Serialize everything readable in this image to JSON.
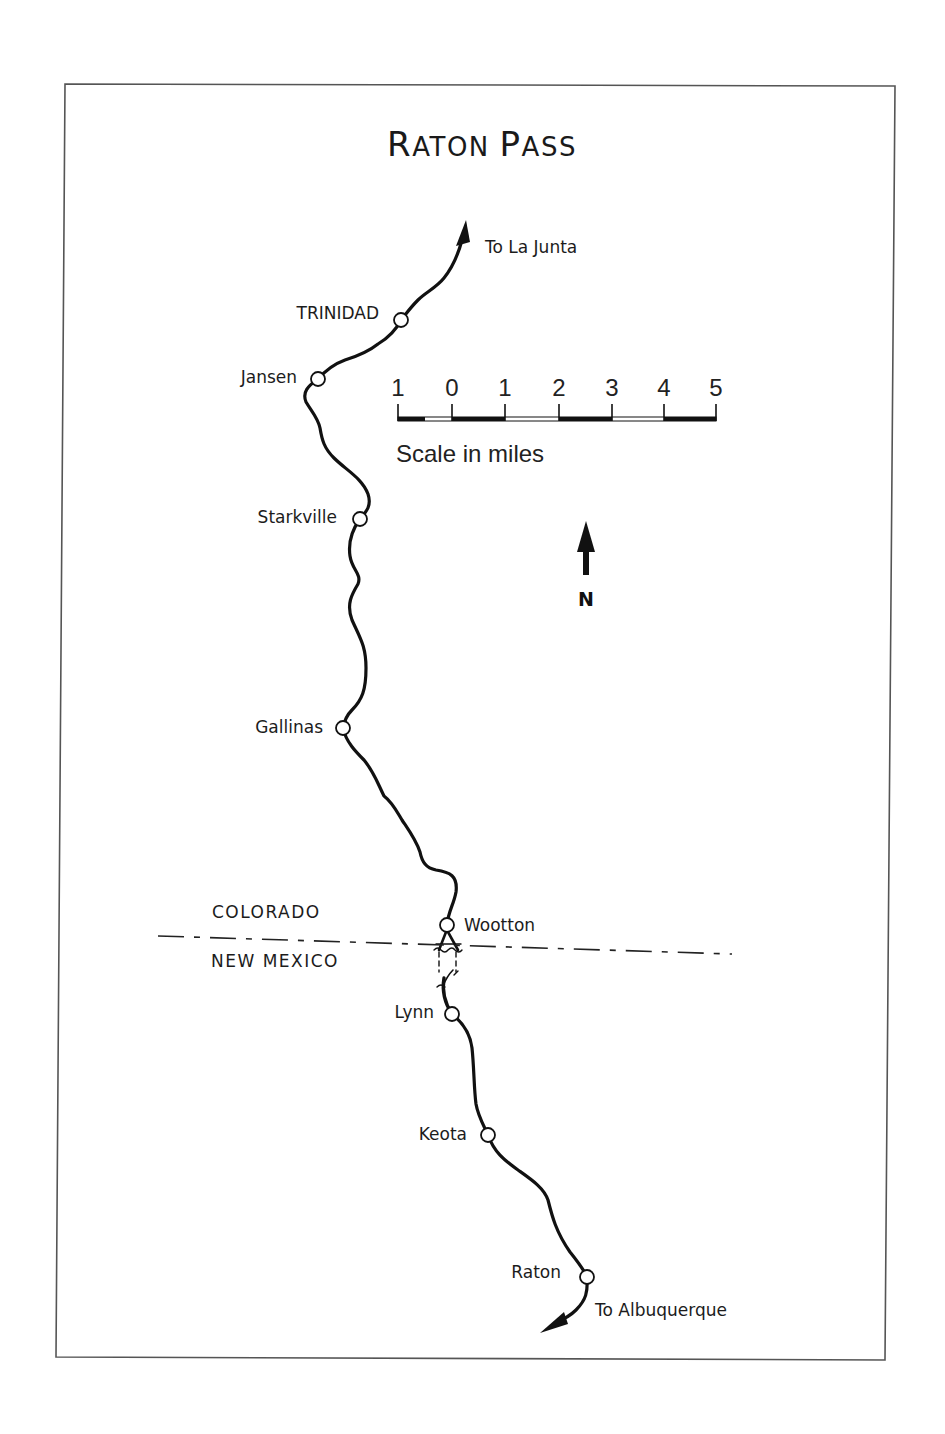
{
  "map": {
    "title_cap_1": "R",
    "title_rest_1": "ATON",
    "title_cap_2": "P",
    "title_rest_2": "ASS",
    "title_full": "Raton Pass",
    "colors": {
      "route": "#111111",
      "frame": "#555555",
      "station_fill": "#ffffff",
      "text": "#1c1c1c"
    }
  },
  "directions": {
    "north_end": "To La Junta",
    "south_end": "To Albuquerque"
  },
  "stations": [
    {
      "name": "TRINIDAD",
      "x": 401,
      "y": 320
    },
    {
      "name": "Jansen",
      "x": 318,
      "y": 379
    },
    {
      "name": "Starkville",
      "x": 360,
      "y": 519
    },
    {
      "name": "Gallinas",
      "x": 343,
      "y": 728
    },
    {
      "name": "Wootton",
      "x": 447,
      "y": 925
    },
    {
      "name": "Lynn",
      "x": 452,
      "y": 1014
    },
    {
      "name": "Keota",
      "x": 488,
      "y": 1135
    },
    {
      "name": "Raton",
      "x": 587,
      "y": 1277
    }
  ],
  "states": {
    "north": "COLORADO",
    "south": "NEW MEXICO"
  },
  "scale": {
    "ticks": [
      "1",
      "0",
      "1",
      "2",
      "3",
      "4",
      "5"
    ],
    "caption": "Scale in miles",
    "unit": "miles"
  },
  "north_arrow": {
    "label": "N"
  }
}
